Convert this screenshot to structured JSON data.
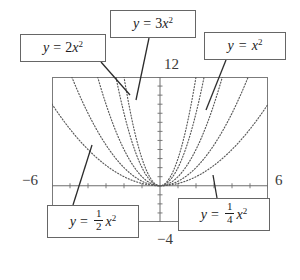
{
  "figure": {
    "axis_labels": {
      "x_min": "−6",
      "x_max": "6",
      "y_max": "12",
      "y_min": "−4"
    },
    "callouts": [
      {
        "id": "2x2",
        "text": "y = 2x²"
      },
      {
        "id": "3x2",
        "text": "y = 3x²"
      },
      {
        "id": "x2",
        "text": "y = x²"
      },
      {
        "id": "half",
        "text": "y = 1/2 x²"
      },
      {
        "id": "qtr",
        "text": "y = 1/4 x²"
      }
    ],
    "parts": {
      "y": "y",
      "equals": "=",
      "x": "x",
      "exp2": "2",
      "coef2": "2",
      "coef3": "3",
      "half_num": "1",
      "half_den": "2",
      "qtr_num": "1",
      "qtr_den": "4"
    }
  },
  "chart_data": {
    "type": "line",
    "title": "",
    "xlabel": "",
    "ylabel": "",
    "xlim": [
      -6,
      6
    ],
    "ylim": [
      -4,
      12
    ],
    "grid": false,
    "legend": "callout-boxes",
    "x_tick_step": 1,
    "y_tick_step": 1,
    "line_style": "dotted",
    "series": [
      {
        "name": "y = 3x²",
        "coefficient": 3,
        "expression": "3x^2",
        "label_position": "top-center"
      },
      {
        "name": "y = 2x²",
        "coefficient": 2,
        "expression": "2x^2",
        "label_position": "top-left"
      },
      {
        "name": "y = x²",
        "coefficient": 1,
        "expression": "x^2",
        "label_position": "top-right"
      },
      {
        "name": "y = 1/2 x²",
        "coefficient": 0.5,
        "expression": "0.5x^2",
        "label_position": "bottom-left"
      },
      {
        "name": "y = 1/4 x²",
        "coefficient": 0.25,
        "expression": "0.25x^2",
        "label_position": "bottom-right"
      }
    ],
    "colors": {
      "curve": "#585858",
      "frame": "#7b7b7b",
      "axis": "#6d6d6d",
      "box_border": "#666666",
      "text": "#1c1c1c"
    }
  }
}
